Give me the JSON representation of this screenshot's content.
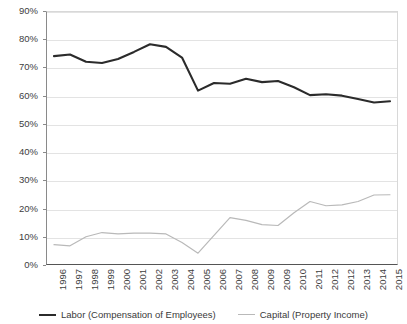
{
  "chart_data": {
    "type": "line",
    "title": "",
    "xlabel": "",
    "ylabel": "",
    "ylim": [
      0,
      90
    ],
    "ytick_labels": [
      "0%",
      "10%",
      "20%",
      "30%",
      "40%",
      "50%",
      "60%",
      "70%",
      "80%",
      "90%"
    ],
    "ytick_values": [
      0,
      10,
      20,
      30,
      40,
      50,
      60,
      70,
      80,
      90
    ],
    "grid": true,
    "legend_position": "bottom-center",
    "categories": [
      "1996",
      "1997",
      "1998",
      "1999",
      "2000",
      "2001",
      "2002",
      "2003",
      "2004",
      "2005",
      "2006",
      "2007",
      "2008",
      "2009",
      "2009",
      "2010",
      "2011",
      "2012",
      "2012",
      "2013",
      "2014",
      "2015"
    ],
    "series": [
      {
        "name": "Labor (Compensation of Employees)",
        "color": "#2b2b2b",
        "values": [
          74.0,
          74.6,
          72.0,
          71.6,
          73.0,
          75.5,
          78.2,
          77.3,
          73.5,
          61.8,
          64.5,
          64.2,
          66.0,
          64.8,
          65.2,
          63.0,
          60.2,
          60.5,
          60.0,
          58.8,
          57.6,
          58.0
        ]
      },
      {
        "name": "Capital (Property Income)",
        "color": "#b9b9b9",
        "values": [
          7.2,
          6.8,
          10.0,
          11.5,
          11.0,
          11.3,
          11.3,
          11.0,
          8.0,
          4.2,
          10.5,
          16.8,
          15.8,
          14.3,
          14.0,
          18.5,
          22.5,
          21.0,
          21.3,
          22.5,
          24.8,
          24.9
        ]
      }
    ]
  },
  "legend": {
    "items": [
      {
        "label": "Labor (Compensation of Employees)",
        "key": "labor"
      },
      {
        "label": "Capital (Property Income)",
        "key": "capital"
      }
    ]
  }
}
